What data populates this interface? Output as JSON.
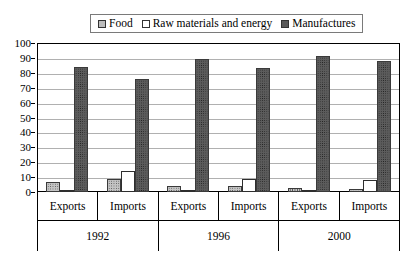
{
  "chart_data": {
    "type": "bar",
    "title": "",
    "subtitle": "",
    "xlabel": "",
    "ylabel": "",
    "ylim": [
      0,
      100
    ],
    "ytick_step": 10,
    "yticks": [
      100,
      90,
      80,
      70,
      60,
      50,
      40,
      30,
      20,
      10,
      0
    ],
    "grid": true,
    "legend_position": "top",
    "categories": [
      "Exports",
      "Imports",
      "Exports",
      "Imports",
      "Exports",
      "Imports"
    ],
    "group_labels": [
      "1992",
      "1996",
      "2000"
    ],
    "series": [
      {
        "name": "Food",
        "values": [
          7,
          9,
          4,
          4,
          3,
          2
        ]
      },
      {
        "name": "Raw materials and energy",
        "values": [
          1,
          14,
          1,
          9,
          1,
          8
        ]
      },
      {
        "name": "Manufactures",
        "values": [
          84,
          76,
          89,
          83,
          91,
          88
        ]
      }
    ]
  },
  "legend": {
    "items": [
      {
        "label": "Food",
        "swatch": "food-swatch-icon"
      },
      {
        "label": "Raw materials and energy",
        "swatch": "raw-materials-swatch-icon"
      },
      {
        "label": "Manufactures",
        "swatch": "manufactures-swatch-icon"
      }
    ]
  },
  "colors": {
    "food": "#c4c4c4",
    "raw_materials": "#ffffff",
    "manufactures": "#5c5c5c",
    "gridline": "#b0b0b0",
    "axis": "#000000",
    "background": "#ffffff"
  }
}
